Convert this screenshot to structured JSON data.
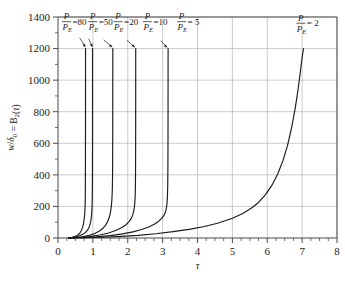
{
  "figure": {
    "name": "buckling-amplification-chart",
    "background": "#ffffff",
    "curve_color": "#1a1a1a",
    "grid_color": "#b4b4b4",
    "axis_color": "#4a4a4a"
  },
  "chart_data": {
    "type": "line",
    "title": "",
    "subtitle": "",
    "xlabel": "τ",
    "ylabel": "w/δ₀ = B₂(τ)",
    "xlim": [
      0,
      8
    ],
    "ylim": [
      0,
      1400
    ],
    "xticks": [
      0,
      1,
      2,
      3,
      4,
      5,
      6,
      7,
      8
    ],
    "xtick_labels": [
      "0",
      "1",
      "2",
      "3",
      "4",
      "5",
      "6",
      "7",
      "8"
    ],
    "x_minor_step": 0.25,
    "yticks": [
      0,
      200,
      400,
      600,
      800,
      1000,
      1200,
      1400
    ],
    "ytick_labels": [
      "0",
      "200",
      "400",
      "600",
      "800",
      "1000",
      "1200",
      "1400"
    ],
    "y_minor_step": 100,
    "grid": true,
    "grid_x": true,
    "grid_y": true,
    "legend_position": "inline-annotations",
    "series": [
      {
        "name": "P/P_E = 80",
        "ratio": 80,
        "asymptote": 0.79,
        "label_text": "=80",
        "numerator": "P",
        "denominator": "P",
        "denominator_sub": "E",
        "label_x": 0.1,
        "label_y": 1378,
        "leader_from": [
          0.62,
          1268
        ],
        "leader_to": [
          0.785,
          1210
        ],
        "points": [
          [
            0.3,
            1
          ],
          [
            0.4,
            4
          ],
          [
            0.5,
            10
          ],
          [
            0.55,
            16
          ],
          [
            0.6,
            25
          ],
          [
            0.64,
            36
          ],
          [
            0.67,
            48
          ],
          [
            0.7,
            64
          ],
          [
            0.72,
            80
          ],
          [
            0.74,
            103
          ],
          [
            0.755,
            128
          ],
          [
            0.765,
            152
          ],
          [
            0.772,
            176
          ],
          [
            0.777,
            202
          ],
          [
            0.78,
            230
          ],
          [
            0.7825,
            268
          ],
          [
            0.784,
            306
          ],
          [
            0.7855,
            360
          ],
          [
            0.7865,
            420
          ],
          [
            0.7875,
            510
          ],
          [
            0.7882,
            620
          ],
          [
            0.7888,
            760
          ],
          [
            0.7892,
            900
          ],
          [
            0.7896,
            1050
          ],
          [
            0.7899,
            1200
          ]
        ]
      },
      {
        "name": "P/P_E = 50",
        "ratio": 50,
        "asymptote": 0.99,
        "label_text": "=50",
        "numerator": "P",
        "denominator": "P",
        "denominator_sub": "E",
        "label_x": 0.85,
        "label_y": 1378,
        "leader_from": [
          0.88,
          1262
        ],
        "leader_to": [
          0.985,
          1210
        ],
        "points": [
          [
            0.3,
            1
          ],
          [
            0.45,
            5
          ],
          [
            0.6,
            13
          ],
          [
            0.7,
            22
          ],
          [
            0.78,
            34
          ],
          [
            0.84,
            48
          ],
          [
            0.88,
            63
          ],
          [
            0.91,
            80
          ],
          [
            0.935,
            102
          ],
          [
            0.953,
            128
          ],
          [
            0.965,
            154
          ],
          [
            0.972,
            178
          ],
          [
            0.977,
            204
          ],
          [
            0.9805,
            232
          ],
          [
            0.9832,
            270
          ],
          [
            0.9852,
            312
          ],
          [
            0.9868,
            365
          ],
          [
            0.988,
            430
          ],
          [
            0.9889,
            520
          ],
          [
            0.9895,
            630
          ],
          [
            0.9899,
            770
          ],
          [
            0.99025,
            920
          ],
          [
            0.99045,
            1060
          ],
          [
            0.9906,
            1200
          ]
        ]
      },
      {
        "name": "P/P_E = 20",
        "ratio": 20,
        "asymptote": 1.57,
        "label_text": "=20",
        "numerator": "P",
        "denominator": "P",
        "denominator_sub": "E",
        "label_x": 1.58,
        "label_y": 1378,
        "leader_from": [
          1.31,
          1255
        ],
        "leader_to": [
          1.555,
          1208
        ],
        "points": [
          [
            0.3,
            0
          ],
          [
            0.5,
            3
          ],
          [
            0.7,
            8
          ],
          [
            0.9,
            17
          ],
          [
            1.05,
            28
          ],
          [
            1.18,
            43
          ],
          [
            1.28,
            60
          ],
          [
            1.36,
            80
          ],
          [
            1.42,
            102
          ],
          [
            1.465,
            128
          ],
          [
            1.497,
            156
          ],
          [
            1.518,
            182
          ],
          [
            1.532,
            208
          ],
          [
            1.543,
            236
          ],
          [
            1.552,
            272
          ],
          [
            1.558,
            315
          ],
          [
            1.5625,
            370
          ],
          [
            1.5655,
            440
          ],
          [
            1.5675,
            530
          ],
          [
            1.569,
            650
          ],
          [
            1.57,
            790
          ],
          [
            1.5707,
            950
          ],
          [
            1.5712,
            1080
          ],
          [
            1.5716,
            1200
          ]
        ]
      },
      {
        "name": "P/P_E = 10",
        "ratio": 10,
        "asymptote": 2.22,
        "label_text": "=10",
        "numerator": "P",
        "denominator": "P",
        "denominator_sub": "E",
        "label_x": 2.42,
        "label_y": 1378,
        "leader_from": [
          1.98,
          1252
        ],
        "leader_to": [
          2.205,
          1208
        ],
        "points": [
          [
            0.3,
            0
          ],
          [
            0.6,
            3
          ],
          [
            0.9,
            9
          ],
          [
            1.2,
            19
          ],
          [
            1.45,
            32
          ],
          [
            1.65,
            47
          ],
          [
            1.82,
            65
          ],
          [
            1.95,
            84
          ],
          [
            2.04,
            104
          ],
          [
            2.1,
            124
          ],
          [
            2.145,
            148
          ],
          [
            2.175,
            175
          ],
          [
            2.193,
            202
          ],
          [
            2.205,
            230
          ],
          [
            2.2125,
            265
          ],
          [
            2.2175,
            305
          ],
          [
            2.221,
            355
          ],
          [
            2.2235,
            420
          ],
          [
            2.2253,
            510
          ],
          [
            2.2265,
            620
          ],
          [
            2.2274,
            760
          ],
          [
            2.228,
            900
          ],
          [
            2.2285,
            1050
          ],
          [
            2.2289,
            1200
          ]
        ]
      },
      {
        "name": "P/P_E = 5",
        "ratio": 5,
        "asymptote": 3.14,
        "label_text": "= 5",
        "numerator": "P",
        "denominator": "P",
        "denominator_sub": "E",
        "label_x": 3.4,
        "label_y": 1378,
        "leader_from": [
          2.95,
          1250
        ],
        "leader_to": [
          3.125,
          1206
        ],
        "points": [
          [
            0.3,
            0
          ],
          [
            0.7,
            2
          ],
          [
            1.1,
            7
          ],
          [
            1.5,
            15
          ],
          [
            1.85,
            26
          ],
          [
            2.15,
            39
          ],
          [
            2.4,
            54
          ],
          [
            2.6,
            70
          ],
          [
            2.76,
            87
          ],
          [
            2.88,
            105
          ],
          [
            2.975,
            124
          ],
          [
            3.045,
            146
          ],
          [
            3.085,
            168
          ],
          [
            3.11,
            192
          ],
          [
            3.125,
            216
          ],
          [
            3.134,
            244
          ],
          [
            3.1405,
            280
          ],
          [
            3.1455,
            325
          ],
          [
            3.149,
            385
          ],
          [
            3.1515,
            465
          ],
          [
            3.1535,
            570
          ],
          [
            3.1548,
            700
          ],
          [
            3.1558,
            860
          ],
          [
            3.1565,
            1020
          ],
          [
            3.157,
            1200
          ]
        ]
      },
      {
        "name": "P/P_E = 2",
        "ratio": 2,
        "asymptote": 7.05,
        "label_text": "= 2",
        "numerator": "P",
        "denominator": "P",
        "denominator_sub": "E",
        "label_x": 6.82,
        "label_y": 1368,
        "leader_from": null,
        "leader_to": null,
        "points": [
          [
            0.3,
            0
          ],
          [
            0.8,
            2
          ],
          [
            1.3,
            5
          ],
          [
            1.8,
            10
          ],
          [
            2.3,
            17
          ],
          [
            2.8,
            27
          ],
          [
            3.3,
            40
          ],
          [
            3.8,
            56
          ],
          [
            4.2,
            73
          ],
          [
            4.6,
            95
          ],
          [
            5.0,
            125
          ],
          [
            5.3,
            155
          ],
          [
            5.55,
            190
          ],
          [
            5.75,
            225
          ],
          [
            5.95,
            275
          ],
          [
            6.15,
            340
          ],
          [
            6.3,
            405
          ],
          [
            6.45,
            490
          ],
          [
            6.58,
            585
          ],
          [
            6.7,
            700
          ],
          [
            6.8,
            820
          ],
          [
            6.88,
            935
          ],
          [
            6.95,
            1055
          ],
          [
            7.0,
            1145
          ],
          [
            7.04,
            1200
          ]
        ]
      }
    ]
  }
}
